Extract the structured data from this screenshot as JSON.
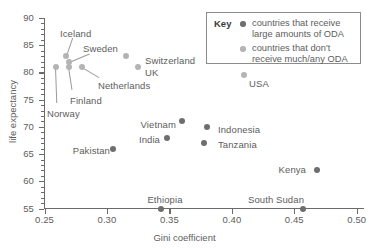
{
  "chart_data": {
    "type": "scatter",
    "title": "",
    "xlabel": "Gini coefficient",
    "ylabel": "life expectancy",
    "xlim": [
      0.25,
      0.505
    ],
    "ylim": [
      55,
      90
    ],
    "xticks": [
      "0.25",
      "0.30",
      "0.35",
      "0.40",
      "0.45",
      "0.50"
    ],
    "xtick_values": [
      0.25,
      0.3,
      0.35,
      0.4,
      0.45,
      0.5
    ],
    "yticks": [
      "55",
      "60",
      "65",
      "70",
      "75",
      "80",
      "85",
      "90"
    ],
    "ytick_values": [
      55,
      60,
      65,
      70,
      75,
      80,
      85,
      90
    ],
    "grid": false,
    "legend_position": "top-right",
    "series": [
      {
        "name": "countries that receive large amounts of ODA",
        "color": "#6e6e6e",
        "marker": "dark",
        "points": [
          {
            "label": "Vietnam",
            "x": 0.36,
            "y": 71
          },
          {
            "label": "India",
            "x": 0.348,
            "y": 68
          },
          {
            "label": "Indonesia",
            "x": 0.38,
            "y": 70
          },
          {
            "label": "Tanzania",
            "x": 0.378,
            "y": 67
          },
          {
            "label": "Pakistan",
            "x": 0.305,
            "y": 66
          },
          {
            "label": "Kenya",
            "x": 0.468,
            "y": 62
          },
          {
            "label": "Ethiopia",
            "x": 0.343,
            "y": 55
          },
          {
            "label": "South Sudan",
            "x": 0.457,
            "y": 55
          }
        ]
      },
      {
        "name": "countries that don't receive much/any ODA",
        "color": "#b4b4b4",
        "marker": "light",
        "points": [
          {
            "label": "Iceland",
            "x": 0.267,
            "y": 83
          },
          {
            "label": "Sweden",
            "x": 0.27,
            "y": 82
          },
          {
            "label": "Finland",
            "x": 0.27,
            "y": 81
          },
          {
            "label": "Norway",
            "x": 0.259,
            "y": 81
          },
          {
            "label": "Netherlands",
            "x": 0.28,
            "y": 81
          },
          {
            "label": "Switzerland",
            "x": 0.315,
            "y": 83
          },
          {
            "label": "UK",
            "x": 0.325,
            "y": 81
          },
          {
            "label": "USA",
            "x": 0.41,
            "y": 79.5
          }
        ]
      }
    ]
  },
  "legend": {
    "title": "Key",
    "entries": [
      {
        "line1": "countries that receive",
        "line2": "large amounts of ODA",
        "color": "#6e6e6e"
      },
      {
        "line1": "countries that don't",
        "line2": "receive much/any ODA",
        "color": "#b4b4b4"
      }
    ]
  },
  "point_labels": {
    "iceland": "Iceland",
    "sweden": "Sweden",
    "finland": "Finland",
    "norway": "Norway",
    "netherlands": "Netherlands",
    "switzerland": "Switzerland",
    "uk": "UK",
    "usa": "USA",
    "vietnam": "Vietnam",
    "india": "India",
    "indonesia": "Indonesia",
    "tanzania": "Tanzania",
    "pakistan": "Pakistan",
    "kenya": "Kenya",
    "ethiopia": "Ethiopia",
    "south_sudan": "South Sudan"
  },
  "axis_titles": {
    "x": "Gini coefficient",
    "y": "life expectancy"
  }
}
